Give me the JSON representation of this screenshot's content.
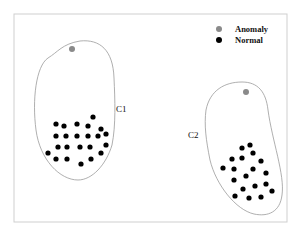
{
  "legend": {
    "items": [
      {
        "label": "Anomaly",
        "color": "#8a8a8a"
      },
      {
        "label": "Normal",
        "color": "#000000"
      }
    ]
  },
  "clusters": [
    {
      "label": "C1",
      "anomaly": [
        72,
        49
      ],
      "normal": [
        [
          56,
          124
        ],
        [
          64,
          126
        ],
        [
          77,
          124
        ],
        [
          88,
          126
        ],
        [
          93,
          117
        ],
        [
          101,
          129
        ],
        [
          106,
          134
        ],
        [
          56,
          136
        ],
        [
          66,
          136
        ],
        [
          77,
          136
        ],
        [
          88,
          136
        ],
        [
          98,
          136
        ],
        [
          58,
          147
        ],
        [
          67,
          147
        ],
        [
          80,
          147
        ],
        [
          90,
          147
        ],
        [
          106,
          145
        ],
        [
          48,
          153
        ],
        [
          56,
          159
        ],
        [
          67,
          159
        ],
        [
          81,
          164
        ],
        [
          91,
          159
        ],
        [
          101,
          153
        ]
      ]
    },
    {
      "label": "C2",
      "anomaly": [
        246,
        92
      ],
      "normal": [
        [
          242,
          148
        ],
        [
          250,
          145
        ],
        [
          232,
          159
        ],
        [
          242,
          158
        ],
        [
          253,
          153
        ],
        [
          261,
          161
        ],
        [
          223,
          168
        ],
        [
          234,
          169
        ],
        [
          253,
          169
        ],
        [
          246,
          176
        ],
        [
          266,
          173
        ],
        [
          234,
          180
        ],
        [
          266,
          184
        ],
        [
          243,
          189
        ],
        [
          255,
          186
        ],
        [
          272,
          191
        ],
        [
          235,
          196
        ],
        [
          249,
          198
        ],
        [
          261,
          197
        ]
      ]
    }
  ],
  "colors": {
    "frame": "#cfcfcf",
    "outline": "#9a9a9a",
    "anomaly": "#8a8a8a",
    "normal": "#000000"
  }
}
